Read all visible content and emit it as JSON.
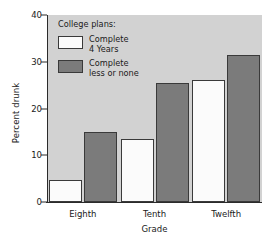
{
  "chart_data": {
    "type": "bar",
    "title": "",
    "xlabel": "Grade",
    "ylabel": "Percent drunk",
    "categories": [
      "Eighth",
      "Tenth",
      "Twelfth"
    ],
    "ylim": [
      0,
      40
    ],
    "yticks": [
      0,
      10,
      20,
      30,
      40
    ],
    "grid": false,
    "legend_position": "inside-top-left",
    "legend_title": "College plans:",
    "series": [
      {
        "name": "Complete 4 Years",
        "name_lines": [
          "Complete",
          "4 Years"
        ],
        "color": "#fbfbfb",
        "values": [
          4.8,
          13.5,
          26.0
        ]
      },
      {
        "name": "Complete less or none",
        "name_lines": [
          "Complete",
          "less or none"
        ],
        "color": "#7b7b7b",
        "values": [
          15.0,
          25.5,
          31.5
        ]
      }
    ]
  }
}
